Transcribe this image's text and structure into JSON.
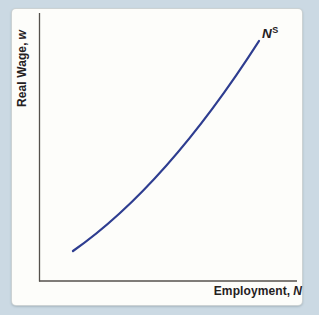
{
  "figure": {
    "ylabel": {
      "text": "Real Wage,",
      "var": "w"
    },
    "xlabel": {
      "text": "Employment,",
      "var": "N"
    },
    "curve_label": {
      "base": "N",
      "sup": "S"
    }
  },
  "colors": {
    "background": "#cbd9e3",
    "card": "#fdfdfa",
    "axis": "#54514c",
    "text": "#25211f",
    "curve": "#2e3d90"
  },
  "chart_data": {
    "type": "line",
    "title": "",
    "xlabel": "Employment, N",
    "ylabel": "Real Wage, w",
    "axes_numeric": false,
    "grid": false,
    "legend": "none",
    "series": [
      {
        "name": "NS",
        "label": "N^S",
        "color": "#2e3d90",
        "shape": "convex-increasing",
        "points_px": [
          [
            73,
            251
          ],
          [
            120,
            214
          ],
          [
            166,
            166
          ],
          [
            212,
            108
          ],
          [
            259,
            41
          ]
        ],
        "bezier": {
          "start": [
            73,
            251
          ],
          "control": [
            166,
            186
          ],
          "end": [
            259,
            41
          ]
        }
      }
    ],
    "plot_area_px": {
      "y_axis_x": 39.5,
      "x_axis_y": 281,
      "axis_top_y": 13,
      "axis_right_x": 297
    }
  }
}
